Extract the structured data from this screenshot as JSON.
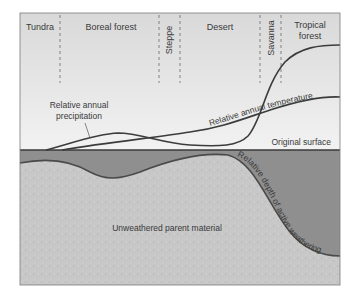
{
  "diagram": {
    "zones": [
      {
        "label": "Tundra",
        "orientation": "horizontal"
      },
      {
        "label": "Boreal forest",
        "orientation": "horizontal"
      },
      {
        "label": "Steppe",
        "orientation": "vertical"
      },
      {
        "label": "Desert",
        "orientation": "horizontal"
      },
      {
        "label": "Savanna",
        "orientation": "vertical"
      },
      {
        "label": "Tropical",
        "label_line2": "forest",
        "orientation": "horizontal"
      }
    ],
    "curves": {
      "precipitation": {
        "label_line1": "Relative annual",
        "label_line2": "precipitation"
      },
      "temperature": {
        "label": "Relative annual temperature"
      },
      "weathering_depth": {
        "label": "Relative depth of active weathering"
      }
    },
    "surface_label": "Original surface",
    "parent_material_label": "Unweathered parent material",
    "colors": {
      "sky": "#eeeeee",
      "weathered_zone": "#8f8f8f",
      "parent_material": "#c9c9c9",
      "curve": "#3c3c3c",
      "frame": "#7a7a7a"
    }
  }
}
